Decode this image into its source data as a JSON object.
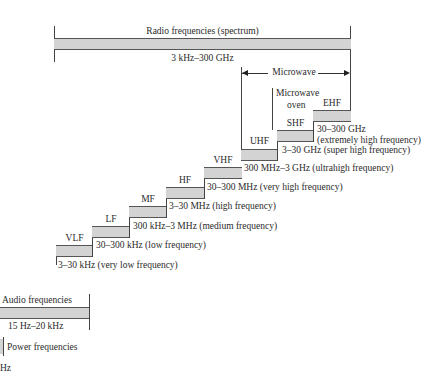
{
  "radio": {
    "title": "Radio frequencies (spectrum)",
    "range": "3 kHz–300 GHz"
  },
  "microwave": {
    "label": "Microwave",
    "oven_line1": "Microwave",
    "oven_line2": "oven"
  },
  "bands": [
    {
      "abbr": "VLF",
      "range": "3–30 kHz (very low frequency)"
    },
    {
      "abbr": "LF",
      "range": "30–300 kHz (low frequency)"
    },
    {
      "abbr": "MF",
      "range": "300 kHz–3 MHz (medium frequency)"
    },
    {
      "abbr": "HF",
      "range": "3–30 MHz (high frequency)"
    },
    {
      "abbr": "VHF",
      "range": "30–300 MHz (very high frequency)"
    },
    {
      "abbr": "UHF",
      "range": "300 MHz–3 GHz (ultrahigh frequency)"
    },
    {
      "abbr": "SHF",
      "range": "3–30 GHz (super high frequency)"
    },
    {
      "abbr": "EHF",
      "range_line1": "30–300 GHz",
      "range_line2": "(extremely high frequency)"
    }
  ],
  "audio": {
    "title": "Audio frequencies",
    "range": "15 Hz–20 kHz"
  },
  "power": {
    "title": "Power frequencies",
    "range_partial": "Hz"
  },
  "colors": {
    "bar_fill": "#d3d3d3",
    "bar_border": "#555555",
    "text": "#2a2a2a"
  }
}
